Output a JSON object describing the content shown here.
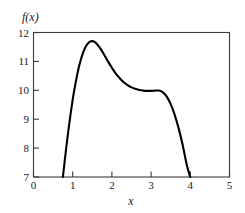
{
  "chart_data": {
    "type": "line",
    "title": "",
    "subtitle": "",
    "xlabel": "x",
    "ylabel": "f(x)",
    "xlim": [
      0,
      5
    ],
    "ylim": [
      7,
      12
    ],
    "xticks": [
      0,
      1,
      2,
      3,
      4,
      5
    ],
    "yticks": [
      7,
      8,
      9,
      10,
      11,
      12
    ],
    "xtick_labels": [
      "0",
      "1",
      "2",
      "3",
      "4",
      "5"
    ],
    "ytick_labels": [
      "7",
      "8",
      "9",
      "10",
      "11",
      "12"
    ],
    "grid": false,
    "legend": null,
    "legend_position": "none",
    "annotations": [],
    "series": [
      {
        "name": "f(x)",
        "color": "#000000",
        "linewidth": 2.1,
        "x": [
          0.75,
          0.8,
          0.85,
          0.9,
          0.95,
          1.0,
          1.05,
          1.1,
          1.15,
          1.2,
          1.25,
          1.3,
          1.35,
          1.4,
          1.45,
          1.5,
          1.55,
          1.6,
          1.65,
          1.7,
          1.8,
          1.9,
          2.0,
          2.1,
          2.2,
          2.3,
          2.4,
          2.5,
          2.6,
          2.7,
          2.8,
          2.9,
          3.0,
          3.1,
          3.2,
          3.3,
          3.4,
          3.5,
          3.6,
          3.7,
          3.8,
          3.9,
          3.95,
          4.0
        ],
        "y": [
          7.0,
          7.6,
          8.18,
          8.72,
          9.22,
          9.68,
          10.08,
          10.44,
          10.76,
          11.02,
          11.24,
          11.42,
          11.55,
          11.64,
          11.69,
          11.7,
          11.68,
          11.63,
          11.55,
          11.46,
          11.24,
          11.0,
          10.78,
          10.58,
          10.42,
          10.28,
          10.18,
          10.1,
          10.05,
          10.01,
          9.99,
          9.98,
          9.98,
          9.99,
          9.99,
          9.93,
          9.78,
          9.52,
          9.16,
          8.7,
          8.14,
          7.48,
          7.22,
          7.0
        ]
      }
    ]
  },
  "figure": {
    "background_color": "#ffffff",
    "curve_color": "#000000",
    "axis_color": "#3b3b3b",
    "text_color": "#1a1a1a"
  }
}
